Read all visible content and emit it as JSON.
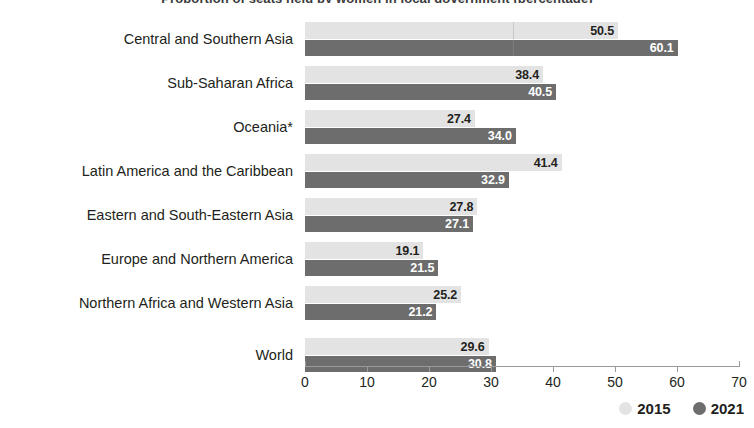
{
  "title_sliver": "Proportion of seats held by women in local government (percentage)",
  "legend": {
    "items": [
      {
        "label": "2015",
        "color": "#e3e3e3",
        "icon": "circle-icon"
      },
      {
        "label": "2021",
        "color": "#6d6d6d",
        "icon": "circle-icon"
      }
    ]
  },
  "axis": {
    "ticks": [
      "0",
      "10",
      "20",
      "30",
      "40",
      "50",
      "60",
      "70"
    ],
    "min": 0,
    "max": 70,
    "step": 10
  },
  "chart_data": {
    "type": "bar",
    "orientation": "horizontal",
    "title": "Proportion of seats held by women in local government (percentage)",
    "xlabel": "",
    "ylabel": "",
    "xlim": [
      0,
      70
    ],
    "grid": false,
    "legend_position": "bottom-right",
    "categories": [
      "Central and Southern Asia",
      "Sub-Saharan Africa",
      "Oceania*",
      "Latin America and the Caribbean",
      "Eastern and South-Eastern Asia",
      "Europe and Northern America",
      "Northern Africa and Western Asia",
      "World"
    ],
    "series": [
      {
        "name": "2015",
        "color": "#e3e3e3",
        "values": [
          50.5,
          38.4,
          27.4,
          41.4,
          27.8,
          19.1,
          25.2,
          29.6
        ]
      },
      {
        "name": "2021",
        "color": "#6d6d6d",
        "values": [
          60.1,
          40.5,
          34.0,
          32.9,
          27.1,
          21.5,
          21.2,
          30.8
        ]
      }
    ],
    "value_labels": {
      "2015": [
        "50.5",
        "38.4",
        "27.4",
        "41.4",
        "27.8",
        "19.1",
        "25.2",
        "29.6"
      ],
      "2021": [
        "60.1",
        "40.5",
        "34.0",
        "32.9",
        "27.1",
        "21.5",
        "21.2",
        "30.8"
      ]
    }
  }
}
